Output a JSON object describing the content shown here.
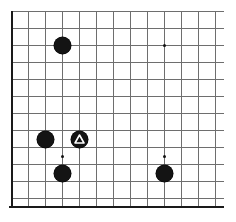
{
  "figure": {
    "name": "go-board-diagram",
    "type": "go-board",
    "width": 236,
    "height": 222
  },
  "board": {
    "line_color": "#6e6e6e",
    "edge_color": "#1a1a1a",
    "background_color": "#ffffff",
    "cell_size": 17,
    "origin_x": 11,
    "origin_y": 11,
    "column_count": 13,
    "row_count": 12,
    "column_positions": [
      11,
      28,
      45,
      62,
      79,
      96,
      113,
      130,
      147,
      164,
      181,
      198,
      215
    ],
    "row_positions": [
      11,
      28,
      45,
      62,
      79,
      96,
      113,
      130,
      147,
      164,
      181,
      198
    ],
    "horizontal_line_start_x": 11,
    "horizontal_line_end_x": 224,
    "vertical_line_start_y": 11,
    "vertical_line_end_y": 207,
    "left_edge_x": 11,
    "bottom_edge_y": 206,
    "bottom_edge_start_x": 9,
    "bottom_edge_end_x": 224,
    "edges_shown": [
      "left",
      "bottom"
    ],
    "edges_cropped": [
      "top",
      "right"
    ]
  },
  "star_points": {
    "color": "#111111",
    "radius": 1.5,
    "points": [
      {
        "name": "star-point-upper-right",
        "x": 164,
        "y": 45
      },
      {
        "name": "star-point-lower-left",
        "x": 62,
        "y": 156
      },
      {
        "name": "star-point-lower-right",
        "x": 164,
        "y": 156
      }
    ]
  },
  "stones": {
    "black_color": "#141414",
    "white_color": "#ffffff",
    "diameter": 17,
    "list": [
      {
        "name": "stone-black-1",
        "color": "black",
        "x": 62,
        "y": 45,
        "mark": "none"
      },
      {
        "name": "stone-black-2",
        "color": "black",
        "x": 45,
        "y": 139,
        "mark": "none"
      },
      {
        "name": "stone-black-3",
        "color": "black",
        "x": 79,
        "y": 139,
        "mark": "triangle",
        "mark_color": "#ffffff"
      },
      {
        "name": "stone-black-4",
        "color": "black",
        "x": 62,
        "y": 173,
        "mark": "none"
      },
      {
        "name": "stone-black-5",
        "color": "black",
        "x": 164,
        "y": 173,
        "mark": "none"
      }
    ]
  },
  "marks": {
    "triangle_label": "triangle",
    "triangle_stroke": "#ffffff",
    "triangle_stroke_width": 1.6
  }
}
